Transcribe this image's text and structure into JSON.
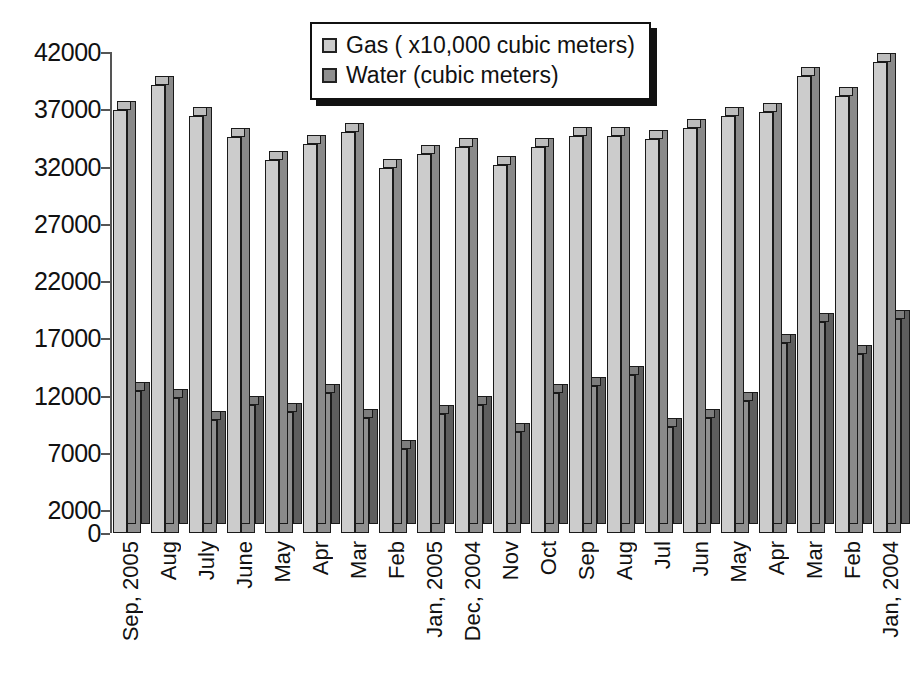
{
  "chart_data": {
    "type": "bar",
    "title": "",
    "subtitle": "",
    "xlabel": "",
    "ylabel": "",
    "ylim": [
      0,
      42000
    ],
    "yticks": [
      0,
      2000,
      7000,
      12000,
      17000,
      22000,
      27000,
      32000,
      37000,
      42000
    ],
    "ytick_labels": [
      "0",
      "2000",
      "7000",
      "12000",
      "17000",
      "22000",
      "27000",
      "32000",
      "37000",
      "42000"
    ],
    "grid": false,
    "legend_position": "top-center",
    "style": "3d-grouped-column",
    "categories": [
      "Sep, 2005",
      "Aug",
      "July",
      "June",
      "May",
      "Apr",
      "Mar",
      "Feb",
      "Jan, 2005",
      "Dec, 2004",
      "Nov",
      "Oct",
      "Sep",
      "Aug",
      "Jul",
      "Jun",
      "May",
      "Apr",
      "Mar",
      "Feb",
      "Jan, 2004"
    ],
    "series": [
      {
        "name": "Gas ( x10,000 cubic meters)",
        "color": "#cccccc",
        "values": [
          36900,
          39100,
          36400,
          34600,
          32600,
          34000,
          35000,
          31900,
          33100,
          33700,
          32100,
          33700,
          34700,
          34700,
          34400,
          35400,
          36400,
          36800,
          39900,
          38200,
          41100
        ]
      },
      {
        "name": "Water (cubic meters)",
        "color": "#8f8f8f",
        "values": [
          12400,
          11800,
          9900,
          11200,
          10600,
          12200,
          10000,
          7300,
          10400,
          11200,
          8800,
          12200,
          12800,
          13800,
          9300,
          10000,
          11500,
          16600,
          18400,
          15600,
          18700
        ]
      }
    ]
  },
  "legend": {
    "items": [
      {
        "label": "Gas ( x10,000 cubic meters)",
        "swatch": "#cccccc"
      },
      {
        "label": "Water (cubic meters)",
        "swatch": "#8f8f8f"
      }
    ]
  }
}
